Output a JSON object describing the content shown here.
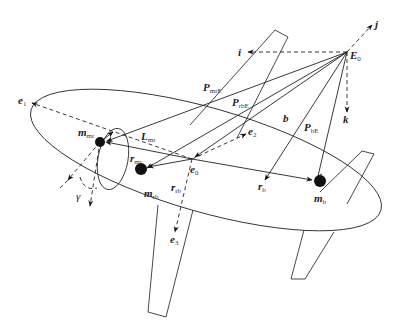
{
  "figure": {
    "labels": {
      "E0": {
        "main": "E",
        "sub": "0"
      },
      "i": {
        "main": "i"
      },
      "j": {
        "main": "j"
      },
      "k": {
        "main": "k"
      },
      "e1": {
        "main": "e",
        "sub": "1"
      },
      "e2": {
        "main": "e",
        "sub": "2"
      },
      "e3": {
        "main": "e",
        "sub": "3"
      },
      "e0": {
        "main": "e",
        "sub": "0"
      },
      "b": {
        "main": "b"
      },
      "PmrE": {
        "main": "P",
        "sub": "mrE"
      },
      "PrbE": {
        "main": "P",
        "sub": "rbE"
      },
      "PbE": {
        "main": "P",
        "sub": "bE"
      },
      "Lmr": {
        "main": "L",
        "sub": "mr"
      },
      "rmr": {
        "main": "r",
        "sub": "mr"
      },
      "rrb": {
        "main": "r",
        "sub": "rb"
      },
      "rb": {
        "main": "r",
        "sub": "b"
      },
      "mmr": {
        "main": "m",
        "sub": "mr"
      },
      "mrb": {
        "main": "m",
        "sub": "rb"
      },
      "mb": {
        "main": "m",
        "sub": "b"
      },
      "gamma": {
        "main": "γ"
      }
    },
    "points": {
      "E0": [
        347,
        52
      ],
      "e0": [
        192,
        159
      ],
      "m_mr": [
        100,
        142
      ],
      "m_rb": [
        141,
        169
      ],
      "m_b": [
        320,
        181
      ]
    },
    "colors": {
      "stroke": "#222222",
      "mass": "#111111",
      "background": "#ffffff"
    }
  }
}
